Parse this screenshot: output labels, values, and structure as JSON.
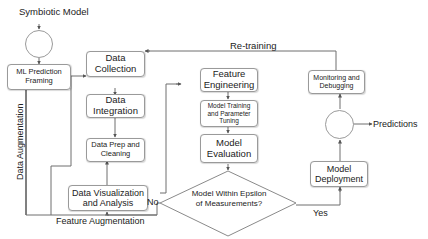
{
  "title": "Symbiotic Model",
  "nodes": {
    "ml_prediction_framing": "ML Prediction Framing",
    "data_collection": "Data Collection",
    "data_integration": "Data Integration",
    "data_prep": "Data Prep and Cleaning",
    "data_viz": "Data Visualization and Analysis",
    "feature_engineering": "Feature Engineering",
    "model_training": "Model Training and Parameter Tuning",
    "model_evaluation": "Model Evaluation",
    "decision": "Model Within Epsilon of Measurements?",
    "model_deployment": "Model Deployment",
    "monitoring": "Monitoring and Debugging"
  },
  "edge_labels": {
    "retraining": "Re-training",
    "data_augmentation": "Data Augmentation",
    "feature_augmentation": "Feature Augmentation",
    "no": "No",
    "yes": "Yes",
    "predictions": "Predictions"
  },
  "colors": {
    "line": "#6e6e6e",
    "box_border": "#9a9a9a",
    "text": "#222222"
  }
}
